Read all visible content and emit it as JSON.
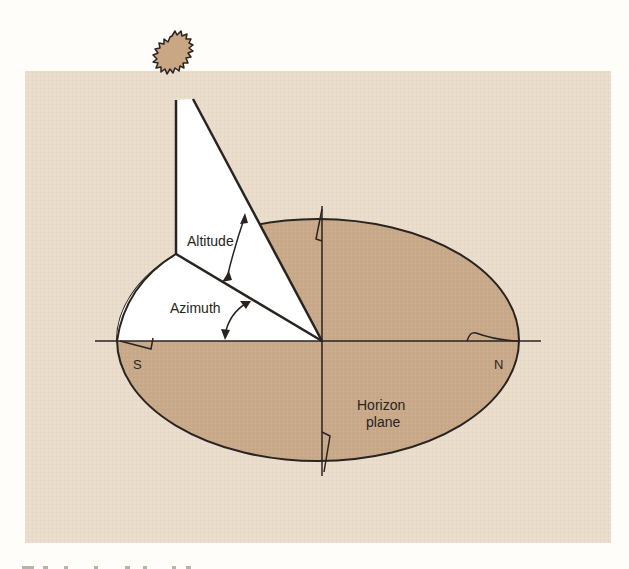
{
  "diagram": {
    "labels": {
      "altitude": "Altitude",
      "azimuth": "Azimuth",
      "south": "S",
      "north": "N",
      "horizon_line1": "Horizon",
      "horizon_line2": "plane"
    },
    "colors": {
      "page_background": "#fefdf9",
      "panel_background": "#e9dccb",
      "horizon_plane_fill": "#c8a98a",
      "sun_fill": "#c9a684",
      "triangle_fill": "#ffffff",
      "line": "#2a2420"
    },
    "elements": [
      "sun",
      "vertical altitude triangle",
      "azimuth wedge on horizon plane",
      "north-south axis",
      "east-west axis",
      "horizon plane ellipse"
    ]
  },
  "caption": {
    "text": ""
  }
}
